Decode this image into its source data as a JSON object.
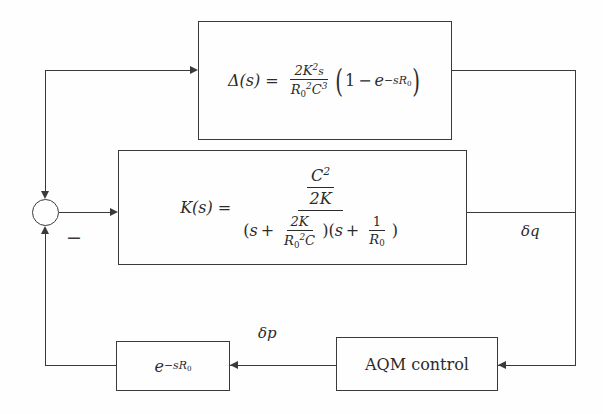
{
  "diagram": {
    "line_color": "#3a3a3a",
    "background_color": "#fefefe"
  },
  "blocks": {
    "delta": {
      "name": "Delta(s) disturbance transfer function block",
      "lhs": "Δ(s)",
      "equals": "=",
      "gain_num": "2K",
      "gain_num_exp": "2",
      "gain_num_tail": "s",
      "gain_den": "R",
      "gain_den_sub": "0",
      "gain_den_exp": "2",
      "gain_den_tail": "C",
      "gain_den_tail_exp": "3",
      "paren_open": "(",
      "one": "1",
      "minus": "−",
      "exp_base": "e",
      "exp_power": "−sR",
      "exp_power_sub": "0",
      "paren_close": ")",
      "plain_text": "Δ(s) = (2K²s)/(R₀²C³) (1 − e^(−sR₀))"
    },
    "k": {
      "name": "K(s) plant transfer function block",
      "lhs": "K(s)",
      "equals": "=",
      "num_top": "C",
      "num_top_exp": "2",
      "num_bot": "2K",
      "den_open": "(",
      "den_s": "s",
      "den_plus": "+",
      "den_frac1_num": "2K",
      "den_frac1_den": "R",
      "den_frac1_den_sub": "0",
      "den_frac1_den_exp": "2",
      "den_frac1_den_tail": "C",
      "den_mid": ")(",
      "den_s2": "s",
      "den_plus2": "+",
      "den_frac2_num": "1",
      "den_frac2_den": "R",
      "den_frac2_den_sub": "0",
      "den_close": ")",
      "plain_text": "K(s) = (C²/2K) / ((s + 2K/(R₀²C))(s + 1/R₀))"
    },
    "delay": {
      "name": "Propagation delay block",
      "base": "e",
      "power": "−sR",
      "power_sub": "0",
      "plain_text": "e^(−sR₀)"
    },
    "aqm": {
      "name": "AQM control block",
      "label": "AQM control"
    }
  },
  "signals": {
    "output_label": "δq",
    "feedback_label": "δp",
    "sum_sign": "−"
  }
}
